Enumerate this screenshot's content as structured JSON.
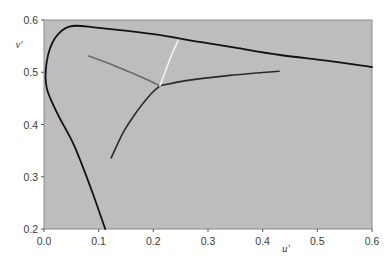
{
  "chart_data": {
    "type": "line",
    "title": "",
    "xlabel": "u'",
    "ylabel": "v'",
    "xlim": [
      0.0,
      0.6
    ],
    "ylim": [
      0.2,
      0.6
    ],
    "xticks": [
      "0.0",
      "0.1",
      "0.2",
      "0.3",
      "0.4",
      "0.5",
      "0.6"
    ],
    "yticks": [
      "0.2",
      "0.3",
      "0.4",
      "0.5",
      "0.6"
    ],
    "grid": false,
    "legend": null,
    "background_color": "#bdbdbd",
    "series": [
      {
        "name": "spectral locus",
        "color": "#111111",
        "points": [
          [
            0.112,
            0.2
          ],
          [
            0.085,
            0.28
          ],
          [
            0.055,
            0.36
          ],
          [
            0.025,
            0.42
          ],
          [
            0.005,
            0.47
          ],
          [
            0.005,
            0.52
          ],
          [
            0.02,
            0.565
          ],
          [
            0.048,
            0.588
          ],
          [
            0.1,
            0.585
          ],
          [
            0.2,
            0.573
          ],
          [
            0.285,
            0.558
          ],
          [
            0.35,
            0.547
          ],
          [
            0.432,
            0.533
          ],
          [
            0.52,
            0.522
          ],
          [
            0.6,
            0.51
          ]
        ]
      },
      {
        "name": "lower dark branch",
        "color": "#2a2a2a",
        "points": [
          [
            0.123,
            0.336
          ],
          [
            0.145,
            0.385
          ],
          [
            0.17,
            0.425
          ],
          [
            0.195,
            0.458
          ],
          [
            0.212,
            0.474
          ]
        ]
      },
      {
        "name": "right dark branch",
        "color": "#2a2a2a",
        "points": [
          [
            0.212,
            0.474
          ],
          [
            0.26,
            0.484
          ],
          [
            0.34,
            0.494
          ],
          [
            0.43,
            0.502
          ]
        ]
      },
      {
        "name": "grey branch",
        "color": "#6a6a6a",
        "points": [
          [
            0.082,
            0.531
          ],
          [
            0.13,
            0.512
          ],
          [
            0.18,
            0.49
          ],
          [
            0.212,
            0.474
          ]
        ]
      },
      {
        "name": "white branch",
        "color": "#f2f2f2",
        "points": [
          [
            0.212,
            0.474
          ],
          [
            0.222,
            0.502
          ],
          [
            0.233,
            0.532
          ],
          [
            0.245,
            0.56
          ]
        ]
      }
    ]
  }
}
